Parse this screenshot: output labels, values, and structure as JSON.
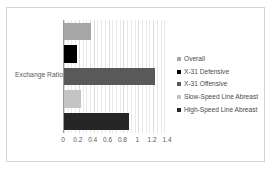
{
  "chart_data": {
    "type": "bar",
    "orientation": "horizontal",
    "title": "",
    "xlabel": "",
    "ylabel": "Exchange Ratio",
    "categories": [
      "Exchange Ratio"
    ],
    "xlim": [
      0,
      1.4
    ],
    "x_ticks": [
      "0",
      "0.2",
      "0.4",
      "0.6",
      "0.8",
      "1",
      "1.2",
      "1.4"
    ],
    "x_tick_values": [
      0,
      0.2,
      0.4,
      0.6,
      0.8,
      1,
      1.2,
      1.4
    ],
    "grid": true,
    "grid_axis": "x",
    "legend_position": "right",
    "series": [
      {
        "name": "Overall",
        "values": [
          0.36
        ],
        "color": "#a6a6a6"
      },
      {
        "name": "X-31 Defensive",
        "values": [
          0.17
        ],
        "color": "#000000"
      },
      {
        "name": "X-31 Offensive",
        "values": [
          1.23
        ],
        "color": "#595959"
      },
      {
        "name": "Slow-Speed Line Abreast",
        "values": [
          0.23
        ],
        "color": "#c4c4c4"
      },
      {
        "name": "High-Speed Line Abreast",
        "values": [
          0.87
        ],
        "color": "#262626"
      }
    ]
  },
  "axis": {
    "y_label": "Exchange Ratio"
  }
}
